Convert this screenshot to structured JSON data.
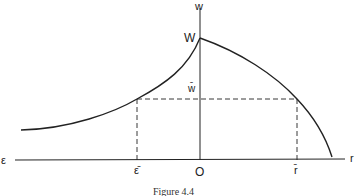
{
  "figure": {
    "caption": "Figure 4.4",
    "labels": {
      "y_axis": "w",
      "x_axis_left": "ε",
      "x_axis_right": "r",
      "peak": "W",
      "w_bar": "w̄",
      "epsilon_bar": "ε̄",
      "origin": "O",
      "r_bar": "r̄"
    },
    "colors": {
      "line": "#222222",
      "background": "#ffffff"
    }
  }
}
